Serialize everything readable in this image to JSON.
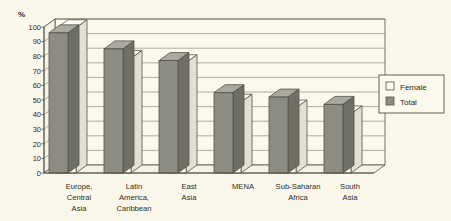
{
  "chart_data": {
    "type": "bar",
    "title": "",
    "subtitle": "",
    "xlabel": "",
    "ylabel": "%",
    "ylim": [
      0,
      100
    ],
    "yticks": [
      0,
      10,
      20,
      30,
      40,
      50,
      60,
      70,
      80,
      90,
      100
    ],
    "ytick_labels": [
      "0",
      "10",
      "20",
      "30",
      "40",
      "50",
      "60",
      "70",
      "80",
      "90",
      "100"
    ],
    "grid": true,
    "grid_axis": "y",
    "legend_position": "right",
    "style": "3d-grouped-bar",
    "categories": [
      "Europe, Central Asia",
      "Latin America, Caribbean",
      "East Asia",
      "MENA",
      "Sub-Saharan Africa",
      "South Asia"
    ],
    "category_label_lines": [
      [
        "Europe,",
        "Central",
        "Asia"
      ],
      [
        "Latin",
        "America,",
        "Caribbean"
      ],
      [
        "East",
        "Asia"
      ],
      [
        "MENA"
      ],
      [
        "Sub-Saharan",
        "Africa"
      ],
      [
        "South",
        "Asia"
      ]
    ],
    "series": [
      {
        "name": "Female",
        "color": "#ffffff",
        "values": [
          94,
          73,
          70,
          43,
          39,
          35
        ]
      },
      {
        "name": "Total",
        "color": "#8c8c82",
        "values": [
          96,
          85,
          77,
          55,
          52,
          47
        ]
      }
    ],
    "legend_entries": [
      {
        "label": "Female",
        "swatch": "#ffffff"
      },
      {
        "label": "Total",
        "swatch": "#8c8c82"
      }
    ]
  },
  "axis": {
    "y_unit_label": "%",
    "tick_0": "0",
    "tick_10": "10",
    "tick_20": "20",
    "tick_30": "30",
    "tick_40": "40",
    "tick_50": "50",
    "tick_60": "60",
    "tick_70": "70",
    "tick_80": "80",
    "tick_90": "90",
    "tick_100": "100"
  },
  "legend": {
    "female_label": "Female",
    "total_label": "Total"
  },
  "categories_text": {
    "c0_l0": "Europe,",
    "c0_l1": "Central",
    "c0_l2": "Asia",
    "c1_l0": "Latin",
    "c1_l1": "America,",
    "c1_l2": "Caribbean",
    "c2_l0": "East",
    "c2_l1": "Asia",
    "c3_l0": "MENA",
    "c4_l0": "Sub-Saharan",
    "c4_l1": "Africa",
    "c5_l0": "South",
    "c5_l1": "Asia"
  },
  "colors": {
    "background": "#faf7ea",
    "bar_total": "#8c8c82",
    "bar_total_side": "#6f6f66",
    "bar_total_top": "#a9a99f",
    "bar_female": "#fdfcf3",
    "bar_female_side": "#e2e0d2",
    "bar_female_top": "#fffef7",
    "line": "#53534a",
    "text": "#2b2b26"
  }
}
